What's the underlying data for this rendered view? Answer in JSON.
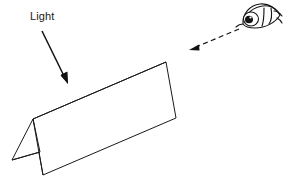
{
  "figure": {
    "background_color": "#ffffff",
    "line_color": "#1a1a1a",
    "width": 285,
    "height": 187
  },
  "labels": {
    "light": "Light"
  },
  "annotations": {
    "light_arrow": {
      "name": "light-direction-arrow",
      "style": "solid",
      "from": [
        42,
        31
      ],
      "to": [
        67,
        82
      ],
      "description": "solid arrow pointing down-right indicating incoming light direction"
    },
    "view_arrow": {
      "name": "viewing-direction-arrow",
      "style": "dashed",
      "from": [
        239,
        29
      ],
      "to": [
        191,
        49
      ],
      "description": "dashed arrow pointing down-left from the eye toward the paper"
    }
  },
  "icons": {
    "eye": {
      "name": "eye-icon",
      "position": [
        238,
        4
      ],
      "size": [
        42,
        30
      ],
      "facing": "left"
    }
  },
  "object": {
    "name": "folded-paper",
    "description": "A sheet of paper folded along a central ridge, standing like a tent, seen in perspective",
    "vertices": {
      "ridge_left": [
        33,
        119
      ],
      "ridge_right": [
        166,
        62
      ],
      "front_bottom_left": [
        43,
        175
      ],
      "front_bottom_right": [
        176,
        118
      ],
      "back_bottom_left": [
        12,
        160
      ],
      "back_panel_mid": [
        40,
        152
      ]
    },
    "faces": [
      {
        "name": "front-face",
        "points": "33,119 166,62 176,118 43,175"
      },
      {
        "name": "back-face-sliver",
        "points": "33,119 12,160 40,152"
      }
    ]
  }
}
